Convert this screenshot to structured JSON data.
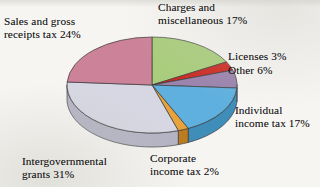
{
  "figure": {
    "kind": "3d-pie-chart",
    "background_color": "#f6f5f2",
    "text_color": "#141414"
  },
  "chart_data": {
    "type": "pie",
    "title": "",
    "subtitle": "",
    "xlabel": "",
    "ylabel": "",
    "legend_position": "none",
    "labels_position": "outside-adjacent",
    "three_d": true,
    "start_angle_deg": 0,
    "direction": "clockwise",
    "units": "percent",
    "total": 100,
    "categories": [
      "Charges and miscellaneous",
      "Licenses",
      "Other",
      "Individual income tax",
      "Corporate income tax",
      "Intergovernmental grants",
      "Sales and gross receipts tax"
    ],
    "values": [
      17,
      3,
      6,
      17,
      2,
      31,
      24
    ],
    "colors": [
      "#a9cd7c",
      "#cc2b23",
      "#9b83ad",
      "#5fb0de",
      "#e9a33c",
      "#d7d7e3",
      "#cc8298"
    ],
    "slices": [
      {
        "label": "Charges and miscellaneous 17%",
        "name": "Charges and miscellaneous",
        "value": 17,
        "color": "#a9cd7c",
        "side_color": "#88a862"
      },
      {
        "label": "Licenses 3%",
        "name": "Licenses",
        "value": 3,
        "color": "#cc2b23",
        "side_color": "#9d1c16"
      },
      {
        "label": "Other 6%",
        "name": "Other",
        "value": 6,
        "color": "#9b83ad",
        "side_color": "#7a668a"
      },
      {
        "label": "Individual income tax 17%",
        "name": "Individual income tax",
        "value": 17,
        "color": "#5fb0de",
        "side_color": "#3f8db9"
      },
      {
        "label": "Corporate income tax 2%",
        "name": "Corporate income tax",
        "value": 2,
        "color": "#e9a33c",
        "side_color": "#bd7c1f"
      },
      {
        "label": "Intergovernmental grants 31%",
        "name": "Intergovernmental grants",
        "value": 31,
        "color": "#d7d7e3",
        "side_color": "#b3b3c4"
      },
      {
        "label": "Sales and gross receipts tax 24%",
        "name": "Sales and gross receipts tax",
        "value": 24,
        "color": "#cc8298",
        "side_color": "#a85f76"
      }
    ]
  },
  "labels": {
    "sales": "Sales and gross\nreceipts tax 24%",
    "charges": "Charges and\nmiscellaneous 17%",
    "licenses": "Licenses 3%",
    "other": "Other 6%",
    "individual": "Individual\nincome tax 17%",
    "corporate": "Corporate\nincome tax 2%",
    "intergovernmental": "Intergovernmental\ngrants 31%"
  }
}
